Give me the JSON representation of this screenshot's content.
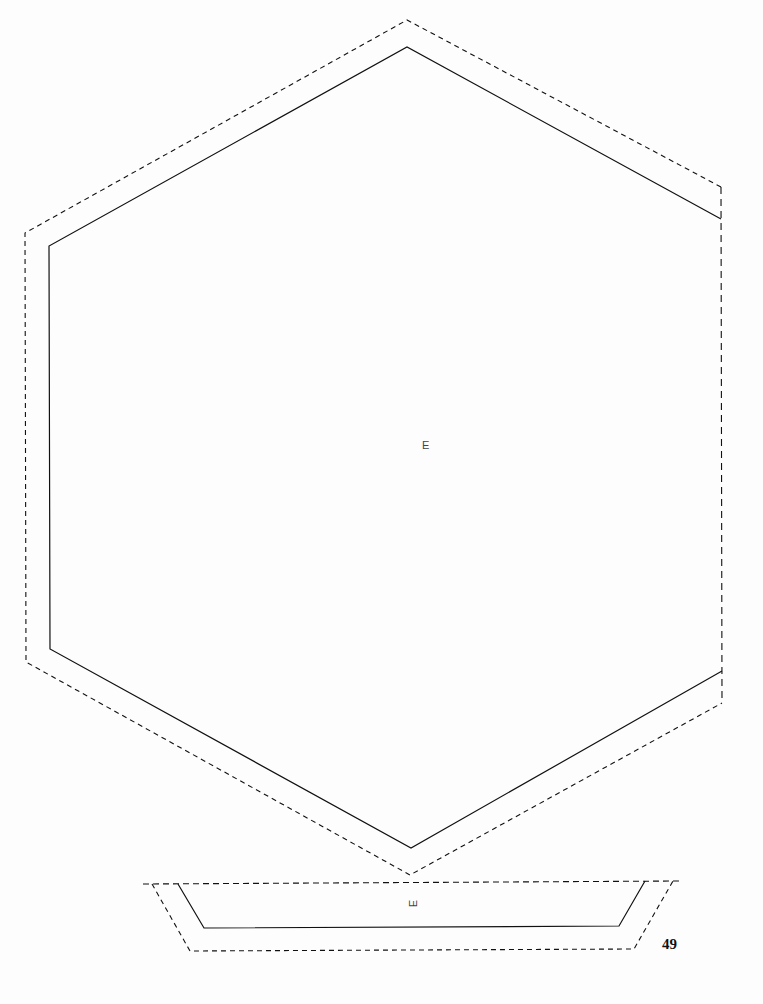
{
  "document": {
    "type": "papercraft-template",
    "page_number": "49"
  },
  "pieces": [
    {
      "id": "hexagon-panel",
      "label": "E",
      "cut_outline": "solid",
      "fold_allowance": "dashed"
    },
    {
      "id": "trapezoid-side-panel",
      "label": "E",
      "label_rotation": "-90deg",
      "cut_outline": "solid",
      "fold_allowance": "dashed"
    }
  ],
  "colors": {
    "background": "#fdfdfd",
    "line": "#111111",
    "label_text": "#444444"
  }
}
